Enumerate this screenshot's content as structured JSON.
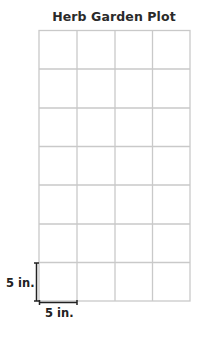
{
  "title": "Herb Garden Plot",
  "grid": {
    "rows": 7,
    "columns": 4,
    "cell_size": "5 in. × 5 in.",
    "line_color": "#c8c8c8"
  },
  "dimensions": {
    "height_label": "5 in.",
    "width_label": "5 in."
  }
}
